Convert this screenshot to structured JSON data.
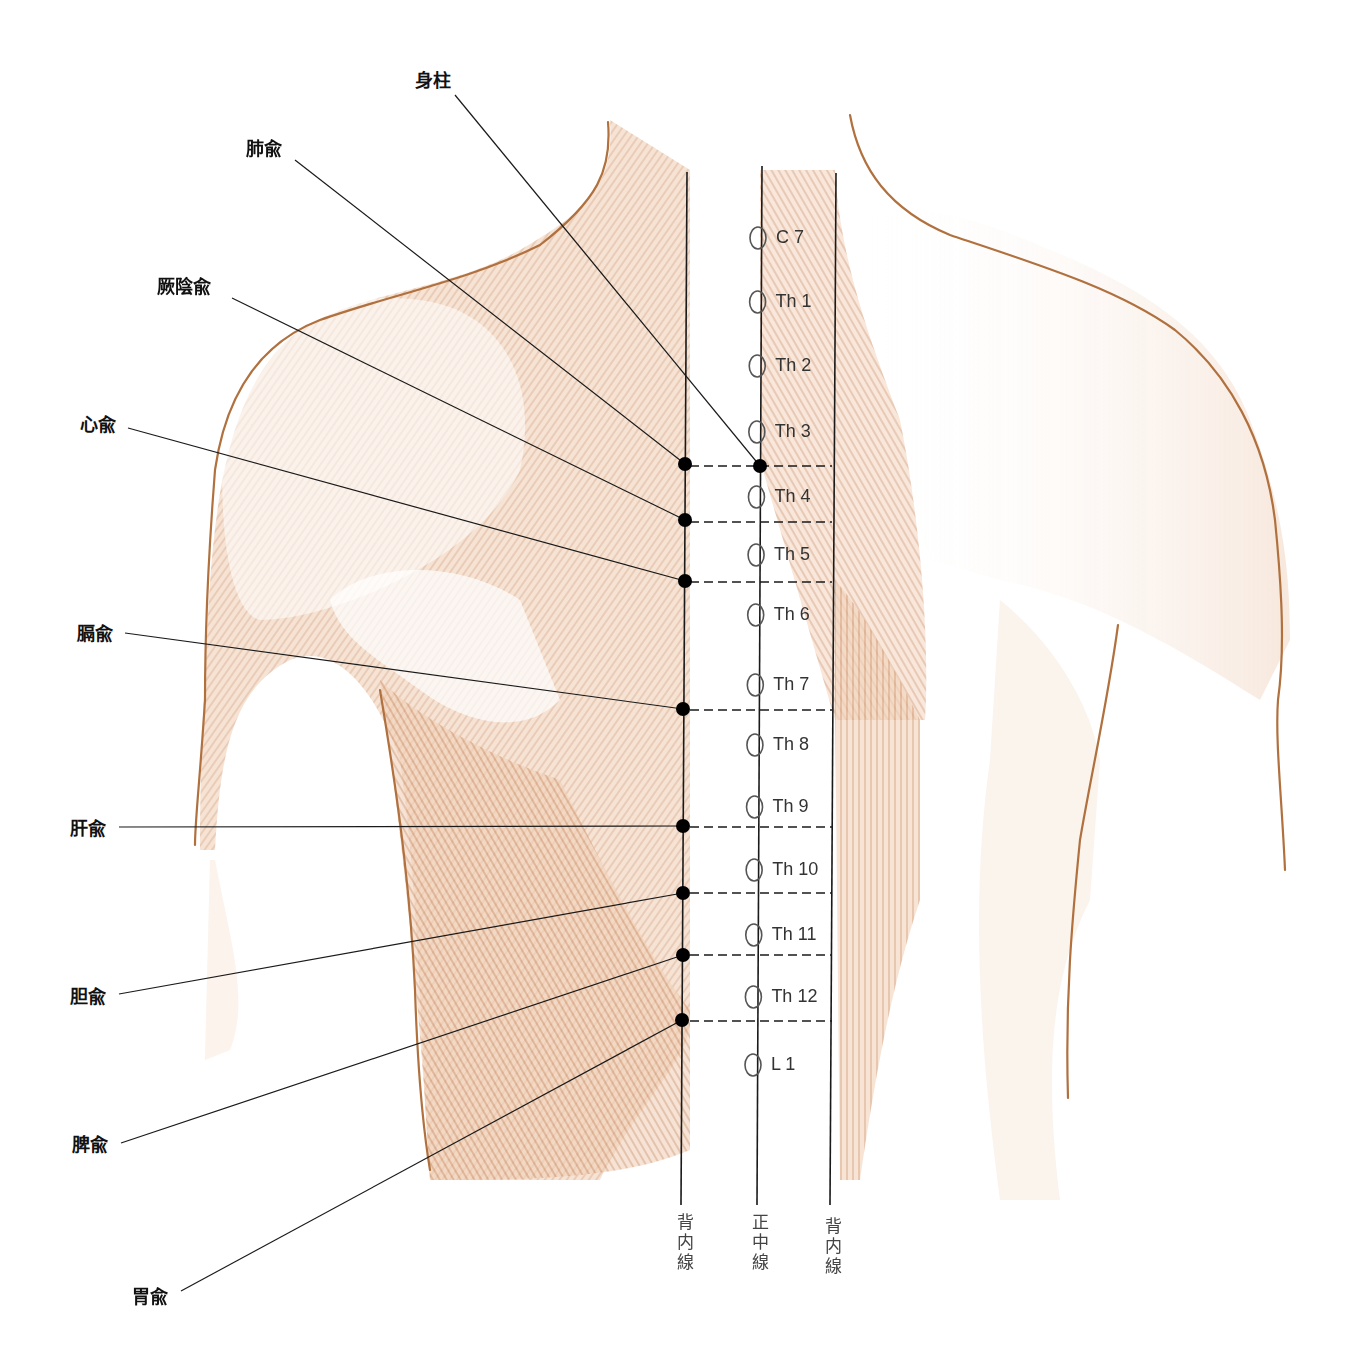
{
  "figure": {
    "colors": {
      "skin_outline": "#b0713f",
      "muscle_shade": "#d9a27a",
      "muscle_light": "#f3ddcb",
      "line": "#1a1a1a",
      "dot": "#000000",
      "vertebra": "#555555"
    }
  },
  "points": [
    {
      "name": "身柱",
      "label_x": 415,
      "label_y": 72,
      "line_from": [
        455,
        95
      ],
      "dot": [
        760,
        466
      ]
    },
    {
      "name": "肺兪",
      "label_x": 246,
      "label_y": 140,
      "line_from": [
        295,
        160
      ],
      "dot": [
        685,
        464
      ]
    },
    {
      "name": "厥陰兪",
      "label_x": 157,
      "label_y": 278,
      "line_from": [
        232,
        298
      ],
      "dot": [
        685,
        520
      ]
    },
    {
      "name": "心兪",
      "label_x": 80,
      "label_y": 416,
      "line_from": [
        128,
        428
      ],
      "dot": [
        685,
        581
      ]
    },
    {
      "name": "膈兪",
      "label_x": 77,
      "label_y": 625,
      "line_from": [
        125,
        633
      ],
      "dot": [
        683,
        709
      ]
    },
    {
      "name": "肝兪",
      "label_x": 70,
      "label_y": 820,
      "line_from": [
        119,
        827
      ],
      "dot": [
        683,
        826
      ]
    },
    {
      "name": "胆兪",
      "label_x": 70,
      "label_y": 988,
      "line_from": [
        119,
        994
      ],
      "dot": [
        683,
        893
      ]
    },
    {
      "name": "脾兪",
      "label_x": 72,
      "label_y": 1136,
      "line_from": [
        121,
        1143
      ],
      "dot": [
        683,
        955
      ]
    },
    {
      "name": "胃兪",
      "label_x": 132,
      "label_y": 1288,
      "line_from": [
        181,
        1291
      ],
      "dot": [
        682,
        1020
      ]
    }
  ],
  "vertebrae": [
    {
      "label": "C 7",
      "y": 238
    },
    {
      "label": "Th 1",
      "y": 302
    },
    {
      "label": "Th 2",
      "y": 366
    },
    {
      "label": "Th 3",
      "y": 432
    },
    {
      "label": "Th 4",
      "y": 497
    },
    {
      "label": "Th 5",
      "y": 555
    },
    {
      "label": "Th 6",
      "y": 615
    },
    {
      "label": "Th 7",
      "y": 685
    },
    {
      "label": "Th 8",
      "y": 745
    },
    {
      "label": "Th 9",
      "y": 807
    },
    {
      "label": "Th 10",
      "y": 870
    },
    {
      "label": "Th 11",
      "y": 935
    },
    {
      "label": "Th 12",
      "y": 997
    },
    {
      "label": "L 1",
      "y": 1065
    }
  ],
  "guide_lines": [
    {
      "label": "背内線",
      "x": 685
    },
    {
      "label": "正中線",
      "x": 760
    },
    {
      "label": "背内線",
      "x": 833
    }
  ],
  "dashed_levels": [
    466,
    522,
    582,
    710,
    827,
    893,
    955,
    1021
  ]
}
